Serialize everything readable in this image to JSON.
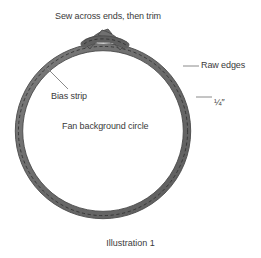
{
  "figure": {
    "caption": "Illustration 1",
    "background_color": "#ffffff",
    "strip_color": "#6e6e6e",
    "strip_outline_color": "#4a4a4a",
    "stitch_color": "#3b3b3b",
    "text_color": "#3a3a3a",
    "leader_line_color": "#8a8a8a",
    "circle": {
      "center_x": 103,
      "center_y": 131,
      "radius": 84,
      "band_width": 7
    }
  },
  "labels": {
    "sew_across": "Sew across ends, then trim",
    "raw_edges": "Raw edges",
    "quarter_inch": "¼″",
    "bias_strip": "Bias strip",
    "fan_background": "Fan background circle"
  },
  "icons": {
    "bias_ring": "bias-strip-ring-icon",
    "crossed_ends": "crossed-strip-ends-icon",
    "stitch_dashes": "dashed-stitch-line-icon",
    "leader_raw_edges": "leader-line-icon",
    "leader_quarter_inch": "leader-line-icon",
    "leader_bias_strip": "leader-line-icon"
  }
}
